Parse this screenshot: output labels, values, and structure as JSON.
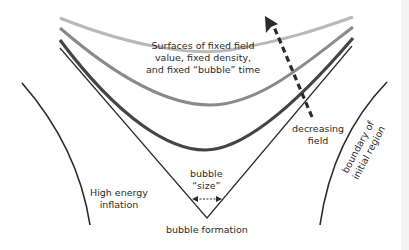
{
  "diagram": {
    "labels": {
      "surfaces": [
        "Surfaces of fixed field",
        "value, fixed density,",
        "and fixed “bubble” time"
      ],
      "decreasing_field": [
        "decreasing",
        "field"
      ],
      "boundary": [
        "boundary of",
        "initial region"
      ],
      "high_energy": [
        "High energy",
        "inflation"
      ],
      "bubble_size": [
        "bubble",
        "“size”"
      ],
      "bubble_formation": "bubble formation"
    },
    "colors": {
      "surface_light": "#b9b9b9",
      "surface_mid": "#8a8a8a",
      "surface_dark": "#444444",
      "line": "#2b2b2b",
      "arrow": "#2b2b2b"
    },
    "elements": [
      "surface-curve-light",
      "surface-curve-mid",
      "surface-curve-dark",
      "light-cone-v",
      "decreasing-field-arrow",
      "bubble-size-arrow",
      "left-boundary-curve",
      "right-boundary-curve"
    ]
  }
}
